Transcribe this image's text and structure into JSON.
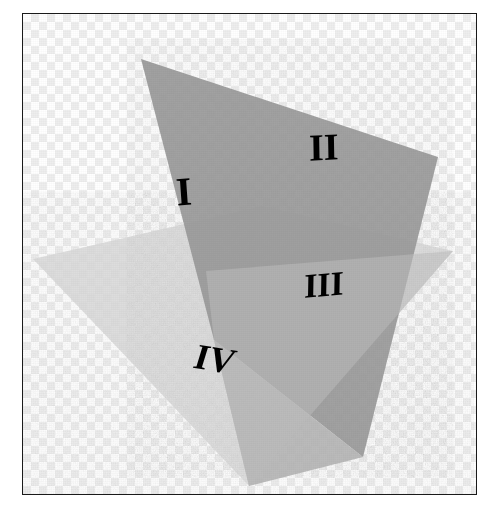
{
  "figure": {
    "background_style": "checkerboard-transparency",
    "border_color": "#1a1a1a",
    "checker_light": "#ffffff",
    "checker_dark": "#eeeeee",
    "checker_cell_px": 8
  },
  "planes": [
    {
      "id": "horizontal-plane",
      "name": "horizontal-plane",
      "fill": "#d8d8d8",
      "opacity": 0.85,
      "points": "32,258 262,205 452,250 248,485"
    },
    {
      "id": "vertical-plane",
      "name": "vertical-plane",
      "fill": "#9a9a9a",
      "opacity": 0.92,
      "points": "140,58 437,156 362,456 213,339"
    },
    {
      "id": "vertical-plane-behind",
      "name": "vertical-plane-lower-overlap",
      "fill": "#b4b4b4",
      "opacity": 0.9,
      "points": "213,339 362,456 248,485"
    },
    {
      "id": "horizontal-over-vertical",
      "name": "horizontal-plane-front-overlap",
      "fill": "#bdbdbd",
      "opacity": 0.55,
      "points": "205,270 452,250 248,485 213,339"
    }
  ],
  "labels": {
    "quadrant_1": "I",
    "quadrant_2": "II",
    "quadrant_3": "III",
    "quadrant_4": "IV"
  },
  "chart_data": {
    "type": "diagram",
    "elements": [
      {
        "kind": "plane",
        "name": "horizontal-plane",
        "tone": "light-gray",
        "hex": "#d8d8d8"
      },
      {
        "kind": "plane",
        "name": "vertical-plane",
        "tone": "medium-gray",
        "hex": "#9a9a9a"
      }
    ],
    "annotations": [
      {
        "text": "I",
        "x": 186,
        "y": 196,
        "region": "upper-left-front"
      },
      {
        "text": "II",
        "x": 318,
        "y": 140,
        "region": "upper-right-back"
      },
      {
        "text": "III",
        "x": 322,
        "y": 282,
        "region": "lower-right-back"
      },
      {
        "text": "IV",
        "x": 212,
        "y": 357,
        "region": "lower-left-front"
      }
    ]
  }
}
